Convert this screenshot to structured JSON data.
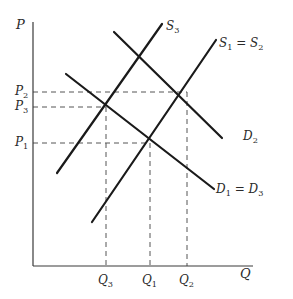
{
  "diagram": {
    "type": "supply-demand",
    "axes": {
      "y_label": "P",
      "x_label": "Q",
      "origin": [
        33,
        266
      ],
      "y_top": 22,
      "x_right": 253
    },
    "price_levels": [
      {
        "name": "P",
        "sub": "2",
        "y": 92
      },
      {
        "name": "P",
        "sub": "3",
        "y": 107
      },
      {
        "name": "P",
        "sub": "1",
        "y": 143
      }
    ],
    "quantity_levels": [
      {
        "name": "Q",
        "sub": "3",
        "x": 106
      },
      {
        "name": "Q",
        "sub": "1",
        "x": 150
      },
      {
        "name": "Q",
        "sub": "2",
        "x": 187
      }
    ],
    "curves": [
      {
        "id": "S3",
        "kind": "supply",
        "label": "S",
        "label_sub": "3",
        "x1": 57,
        "y1": 173,
        "x2": 162,
        "y2": 24
      },
      {
        "id": "S1=S2",
        "kind": "supply",
        "label": "S",
        "label_sub": "1",
        "label_eq": " = S",
        "label_sub2": "2",
        "x1": 92,
        "y1": 222,
        "x2": 216,
        "y2": 40
      },
      {
        "id": "D2",
        "kind": "demand",
        "label": "D",
        "label_sub": "2",
        "x1": 114,
        "y1": 32,
        "x2": 222,
        "y2": 138
      },
      {
        "id": "D1=D3",
        "kind": "demand",
        "label": "D",
        "label_sub": "1",
        "label_eq": " = D",
        "label_sub2": "3",
        "x1": 66,
        "y1": 74,
        "x2": 214,
        "y2": 189
      }
    ],
    "equilibria": [
      {
        "name": "E1",
        "price": "P1",
        "quantity": "Q1",
        "x": 150,
        "y": 143
      },
      {
        "name": "E2",
        "price": "P2",
        "quantity": "Q2",
        "x": 187,
        "y": 92
      },
      {
        "name": "E3",
        "price": "P3",
        "quantity": "Q3",
        "x": 106,
        "y": 107
      }
    ],
    "colors": {
      "line": "#1a1a1a",
      "axis": "#3a3a3a",
      "dashed": "#555555",
      "text": "#2a2a2a"
    }
  }
}
